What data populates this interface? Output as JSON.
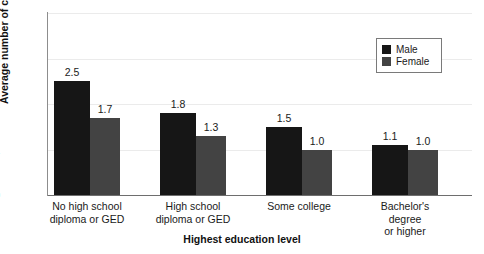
{
  "chart_data": {
    "type": "bar",
    "title": "",
    "subtitle": "",
    "xlabel": "Highest education level",
    "ylabel": "Average number of children",
    "categories": [
      "No high school\ndiploma or GED",
      "High school\ndiploma or GED",
      "Some college",
      "Bachelor's degree\nor higher"
    ],
    "series": [
      {
        "name": "Male",
        "color": "#161616",
        "values": [
          2.5,
          1.8,
          1.5,
          1.1
        ],
        "labels": [
          "2.5",
          "1.8",
          "1.5",
          "1.1"
        ]
      },
      {
        "name": "Female",
        "color": "#434343",
        "values": [
          1.7,
          1.3,
          1.0,
          1.0
        ],
        "labels": [
          "1.7",
          "1.3",
          "1.0",
          "1.0"
        ]
      }
    ],
    "ylim": [
      0,
      4
    ],
    "yticks": [
      0,
      1,
      2,
      3,
      4
    ],
    "ytick_labels": [
      "0",
      "1",
      "2",
      "3",
      "4"
    ],
    "grid": true,
    "grid_color": "#ebebeb",
    "legend_position": "top-right",
    "axis_color": "#6e6e6e",
    "background": "#ffffff"
  },
  "legend": {
    "items": [
      {
        "label": "Male",
        "swatch": "male"
      },
      {
        "label": "Female",
        "swatch": "female"
      }
    ]
  }
}
